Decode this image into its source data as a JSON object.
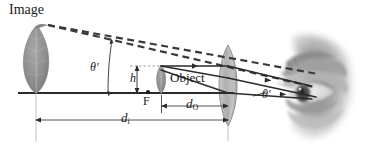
{
  "figure": {
    "kind": "optics-ray-diagram",
    "background_color": "#ffffff",
    "ink_color": "#2b2b2b",
    "leaf_color": "#8e8e8e",
    "lens_color": "#b4b4b4"
  },
  "labels": {
    "image": "Image",
    "object": "Object",
    "theta_prime_left": "θ′",
    "theta_prime_right": "θ′",
    "height_h": "h",
    "focal_point": "F",
    "d_object": "d",
    "d_object_sub": "O",
    "d_image": "d",
    "d_image_sub": "i"
  },
  "elements": {
    "image_leaf": "large-leaf-virtual-image",
    "object_leaf": "small-leaf-object",
    "lens": "biconvex-converging-lens",
    "eye": "human-eye",
    "optical_axis": "horizontal-principal-axis",
    "dashed_rays": "virtual-image-construction-rays",
    "solid_rays": "refracted-rays-to-eye",
    "dim_line_do": "object-distance-dimension",
    "dim_line_di": "image-distance-dimension"
  },
  "geometry": {
    "axis_y": 93,
    "axis_x_start": 18,
    "axis_x_end": 232,
    "lens_center_x": 228,
    "lens_top_y": 45,
    "lens_bottom_y": 126,
    "focal_point_x": 148,
    "focal_point_y": 93,
    "image_tip_x": 48,
    "image_tip_y": 25,
    "object_tip_x": 161,
    "object_tip_y": 66,
    "do_line_y": 106,
    "di_line_y": 120
  }
}
